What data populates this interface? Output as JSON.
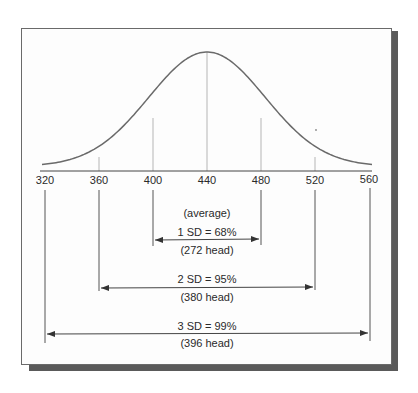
{
  "diagram": {
    "axis": {
      "ticks": [
        "320",
        "360",
        "400",
        "440",
        "480",
        "520",
        "560"
      ],
      "values": [
        320,
        360,
        400,
        440,
        480,
        520,
        560
      ]
    },
    "mean_label": "(average)",
    "ranges": [
      {
        "label": "1 SD = 68%",
        "count": "(272 head)",
        "from": 400,
        "to": 480
      },
      {
        "label": "2 SD = 95%",
        "count": "(380 head)",
        "from": 360,
        "to": 520
      },
      {
        "label": "3 SD = 99%",
        "count": "(396 head)",
        "from": 320,
        "to": 560
      }
    ],
    "colors": {
      "curve": "#6a6a6a",
      "lines": "#555555",
      "guide": "#b5b5b5",
      "text": "#2a2a2a",
      "shadow": "#5a5a5a"
    }
  }
}
